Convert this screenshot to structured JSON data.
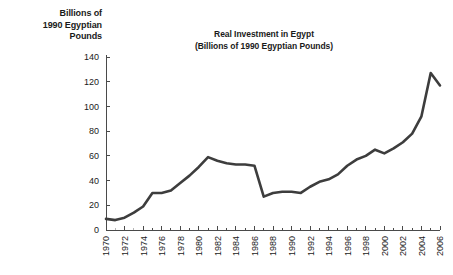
{
  "axis_title": {
    "line1": "Billions of",
    "line2": "1990 Egyptian",
    "line3": "Pounds"
  },
  "title": {
    "line1": "Real Investment in Egypt",
    "line2": "(Billions of 1990 Egyptian Pounds)"
  },
  "colors": {
    "line": "#3d3d3d",
    "axis": "#4a4a4a",
    "text": "#1a1a1a",
    "background": "#ffffff"
  },
  "chart_data": {
    "type": "line",
    "title": "Real Investment in Egypt (Billions of 1990 Egyptian Pounds)",
    "xlabel": "",
    "ylabel": "Billions of 1990 Egyptian Pounds",
    "ylim": [
      0,
      140
    ],
    "xlim": [
      1970,
      2006
    ],
    "grid": false,
    "legend": false,
    "ytick_labels": [
      "0",
      "20",
      "40",
      "60",
      "80",
      "100",
      "120",
      "140"
    ],
    "ytick_values": [
      0,
      20,
      40,
      60,
      80,
      100,
      120,
      140
    ],
    "xtick_labels": [
      "1970",
      "1972",
      "1974",
      "1976",
      "1978",
      "1980",
      "1982",
      "1984",
      "1986",
      "1988",
      "1990",
      "1992",
      "1994",
      "1996",
      "1998",
      "2000",
      "2002",
      "2004",
      "2006"
    ],
    "xtick_values": [
      1970,
      1972,
      1974,
      1976,
      1978,
      1980,
      1982,
      1984,
      1986,
      1988,
      1990,
      1992,
      1994,
      1996,
      1998,
      2000,
      2002,
      2004,
      2006
    ],
    "x": [
      1970,
      1971,
      1972,
      1973,
      1974,
      1975,
      1976,
      1977,
      1978,
      1979,
      1980,
      1981,
      1982,
      1983,
      1984,
      1985,
      1986,
      1987,
      1988,
      1989,
      1990,
      1991,
      1992,
      1993,
      1994,
      1995,
      1996,
      1997,
      1998,
      1999,
      2000,
      2001,
      2002,
      2003,
      2004,
      2005,
      2006
    ],
    "values": [
      9,
      8,
      10,
      14,
      19,
      30,
      30,
      32,
      38,
      44,
      51,
      59,
      56,
      54,
      53,
      53,
      52,
      27,
      30,
      31,
      31,
      30,
      35,
      39,
      41,
      45,
      52,
      57,
      60,
      65,
      62,
      66,
      71,
      78,
      92,
      127,
      117
    ],
    "series": [
      {
        "name": "Real Investment in Egypt",
        "values": [
          9,
          8,
          10,
          14,
          19,
          30,
          30,
          32,
          38,
          44,
          51,
          59,
          56,
          54,
          53,
          53,
          52,
          27,
          30,
          31,
          31,
          30,
          35,
          39,
          41,
          45,
          52,
          57,
          60,
          65,
          62,
          66,
          71,
          78,
          92,
          127,
          117
        ]
      }
    ]
  }
}
